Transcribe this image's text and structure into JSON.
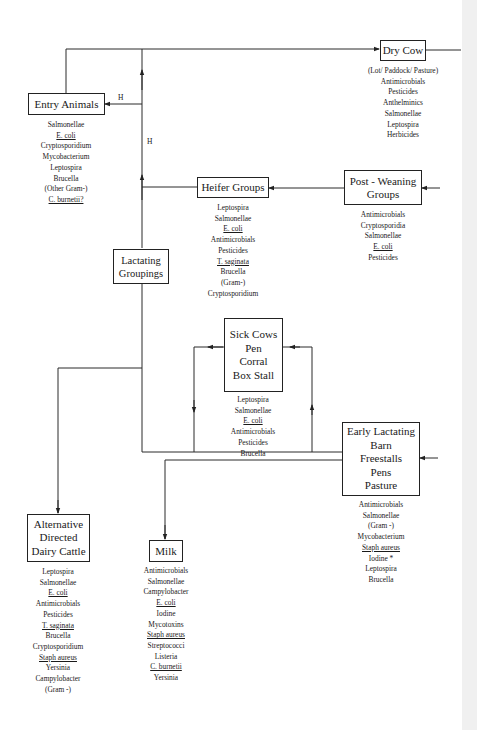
{
  "diagram": {
    "type": "flowchart",
    "edge_labels": {
      "h1": "H",
      "h2": "H"
    },
    "nodes": {
      "entry_animals": {
        "title": [
          "Entry Animals"
        ],
        "items": [
          {
            "text": "Salmonellae",
            "underline": false
          },
          {
            "text": "E. coli",
            "underline": true
          },
          {
            "text": "Cryptosporidium",
            "underline": false
          },
          {
            "text": "Mycobacterium",
            "underline": false
          },
          {
            "text": "Leptospira",
            "underline": false
          },
          {
            "text": "Brucella",
            "underline": false
          },
          {
            "text": "(Other Gram-)",
            "underline": false
          },
          {
            "text": "C. burnetii?",
            "underline": true
          }
        ]
      },
      "dry_cow": {
        "title": [
          "Dry Cow"
        ],
        "items": [
          {
            "text": "(Lot/ Paddock/ Pasture)",
            "underline": false
          },
          {
            "text": "Antimicrobials",
            "underline": false
          },
          {
            "text": "Pesticides",
            "underline": false
          },
          {
            "text": "Anthelminics",
            "underline": false
          },
          {
            "text": "Salmonellae",
            "underline": false
          },
          {
            "text": "Leptospira",
            "underline": false
          },
          {
            "text": "Herbicides",
            "underline": false
          }
        ]
      },
      "heifer_groups": {
        "title": [
          "Heifer Groups"
        ],
        "items": [
          {
            "text": "Leptospira",
            "underline": false
          },
          {
            "text": "Salmonellae",
            "underline": false
          },
          {
            "text": "E. coli",
            "underline": true
          },
          {
            "text": "Antimicrobials",
            "underline": false
          },
          {
            "text": "Pesticides",
            "underline": false
          },
          {
            "text": "T. saginata",
            "underline": true
          },
          {
            "text": "Brucella",
            "underline": false
          },
          {
            "text": "(Gram-)",
            "underline": false
          },
          {
            "text": "Cryptosporidium",
            "underline": false
          }
        ]
      },
      "post_weaning": {
        "title": [
          "Post - Weaning",
          "Groups"
        ],
        "items": [
          {
            "text": "Antimicrobials",
            "underline": false
          },
          {
            "text": "Cryptosporidia",
            "underline": false
          },
          {
            "text": "Salmonellae",
            "underline": false
          },
          {
            "text": "E. coli",
            "underline": true
          },
          {
            "text": "Pesticides",
            "underline": false
          }
        ]
      },
      "lactating_groupings": {
        "title": [
          "Lactating",
          "Groupings"
        ],
        "items": []
      },
      "sick_cows": {
        "title": [
          "Sick Cows",
          "Pen",
          "Corral",
          "Box Stall"
        ],
        "items": [
          {
            "text": "Leptospira",
            "underline": false
          },
          {
            "text": "Salmonellae",
            "underline": false
          },
          {
            "text": "E. coli",
            "underline": true
          },
          {
            "text": "Antimicrobials",
            "underline": false
          },
          {
            "text": "Pesticides",
            "underline": false
          },
          {
            "text": "Brucella",
            "underline": false
          }
        ]
      },
      "early_lactating": {
        "title": [
          "Early Lactating",
          "Barn",
          "Freestalls",
          "Pens",
          "Pasture"
        ],
        "items": [
          {
            "text": "Antimicrobials",
            "underline": false
          },
          {
            "text": "Salmonellae",
            "underline": false
          },
          {
            "text": "(Gram -)",
            "underline": false
          },
          {
            "text": "Mycobacterium",
            "underline": false
          },
          {
            "text": "Staph aureus",
            "underline": true
          },
          {
            "text": "Iodine *",
            "underline": false
          },
          {
            "text": "Leptospira",
            "underline": false
          },
          {
            "text": "Brucella",
            "underline": false
          }
        ]
      },
      "alternative": {
        "title": [
          "Alternative",
          "Directed",
          "Dairy Cattle"
        ],
        "items": [
          {
            "text": "Leptospira",
            "underline": false
          },
          {
            "text": "Salmonellae",
            "underline": false
          },
          {
            "text": "E. coli",
            "underline": true
          },
          {
            "text": "Antimicrobials",
            "underline": false
          },
          {
            "text": "Pesticides",
            "underline": false
          },
          {
            "text": "T. saginata",
            "underline": true
          },
          {
            "text": "Brucella",
            "underline": false
          },
          {
            "text": "Cryptosporidium",
            "underline": false
          },
          {
            "text": "Staph aureus",
            "underline": true
          },
          {
            "text": "Yersinia",
            "underline": false
          },
          {
            "text": "Campylobacter",
            "underline": false
          },
          {
            "text": "(Gram -)",
            "underline": false
          }
        ]
      },
      "milk": {
        "title": [
          "Milk"
        ],
        "items": [
          {
            "text": "Antimicrobials",
            "underline": false
          },
          {
            "text": "Salmonellae",
            "underline": false
          },
          {
            "text": "Campylobacter",
            "underline": false
          },
          {
            "text": "E. coli",
            "underline": true
          },
          {
            "text": "Iodine",
            "underline": false
          },
          {
            "text": "Mycotoxins",
            "underline": false
          },
          {
            "text": "Staph aureus",
            "underline": true
          },
          {
            "text": "Streptococci",
            "underline": false
          },
          {
            "text": "Listeria",
            "underline": false
          },
          {
            "text": "C. burnetii",
            "underline": true
          },
          {
            "text": "Yersinia",
            "underline": false
          }
        ]
      }
    }
  }
}
